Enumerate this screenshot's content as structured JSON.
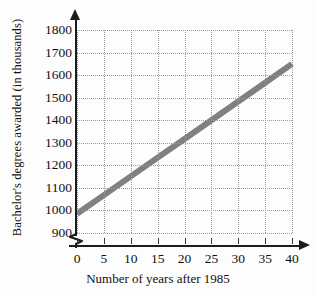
{
  "chart_data": {
    "type": "line",
    "title": "",
    "xlabel": "Number of years after 1985",
    "ylabel": "Bachelor's degrees awarded (in thousands)",
    "xlim": [
      0,
      40
    ],
    "ylim": [
      900,
      1800
    ],
    "xticks": [
      0,
      5,
      10,
      15,
      20,
      25,
      30,
      35,
      40
    ],
    "xtick_labels": [
      "0",
      "5",
      "10",
      "15",
      "20",
      "25",
      "30",
      "35",
      "40"
    ],
    "yticks": [
      900,
      1000,
      1100,
      1200,
      1300,
      1400,
      1500,
      1600,
      1700,
      1800
    ],
    "ytick_labels": [
      "900",
      "1000",
      "1100",
      "1200",
      "1300",
      "1400",
      "1500",
      "1600",
      "1700",
      "1800"
    ],
    "grid": true,
    "grid_style": "dotted",
    "y_axis_break": true,
    "legend": null,
    "series": [
      {
        "name": "Bachelor's degrees awarded",
        "color": "#808080",
        "line_width": 6,
        "x": [
          0,
          5,
          10,
          15,
          20,
          25,
          30,
          35,
          40
        ],
        "values": [
          985,
          1068,
          1151,
          1234,
          1317,
          1400,
          1483,
          1566,
          1650
        ]
      }
    ]
  },
  "axes": {
    "y_title": "Bachelor's degrees awarded (in thousands)",
    "x_title": "Number of years after 1985"
  },
  "colors": {
    "line": "#808080",
    "axis": "#1c1c1c",
    "grid": "#9a9a9a",
    "text": "#111111",
    "background": "#fdfdfd"
  }
}
